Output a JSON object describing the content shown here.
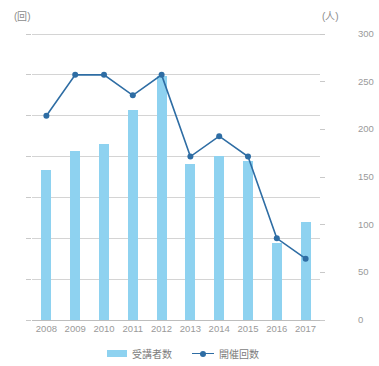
{
  "chart_data": {
    "type": "bar",
    "title": "",
    "subtitle": "",
    "xlabel": "",
    "ylabel": "",
    "grid": true,
    "legend_position": "bottom-center",
    "categories": [
      "2008",
      "2009",
      "2010",
      "2011",
      "2012",
      "2013",
      "2014",
      "2015",
      "2016",
      "2017"
    ],
    "axes": {
      "left": {
        "unit_label": "(回)",
        "ticks": [
          0,
          2,
          4,
          6,
          8,
          10,
          12,
          14
        ],
        "tick_labels": [
          "0",
          "2",
          "4",
          "6",
          "8",
          "10",
          "12",
          "14"
        ],
        "range": [
          0,
          14
        ],
        "series_ref": "開催回数"
      },
      "right": {
        "unit_label": "(人)",
        "ticks": [
          0,
          50,
          100,
          150,
          200,
          250,
          300
        ],
        "tick_labels": [
          "0",
          "50",
          "100",
          "150",
          "200",
          "250",
          "300"
        ],
        "range": [
          0,
          300
        ],
        "series_ref": "受講者数"
      }
    },
    "series": [
      {
        "name": "受講者数",
        "type": "bar",
        "axis": "right",
        "color": "#8ed2f0",
        "values": [
          157,
          177,
          185,
          220,
          256,
          164,
          172,
          167,
          81,
          103
        ]
      },
      {
        "name": "開催回数",
        "type": "line",
        "axis": "left",
        "color": "#2e6da4",
        "values": [
          10,
          12,
          12,
          11,
          12,
          8,
          9,
          8,
          4,
          3
        ]
      }
    ]
  },
  "legend": {
    "items": [
      {
        "label": "受講者数",
        "marker": "bar-swatch",
        "color": "#8ed2f0"
      },
      {
        "label": "開催回数",
        "marker": "line-dot-swatch",
        "color": "#2e6da4"
      }
    ]
  },
  "colors": {
    "bar": "#8ed2f0",
    "line": "#2e6da4",
    "grid": "#d4d4d4",
    "baseline": "#bdbdbd",
    "tick_text": "#9a9a9a",
    "legend_text": "#7d7d7d",
    "background": "#ffffff"
  }
}
